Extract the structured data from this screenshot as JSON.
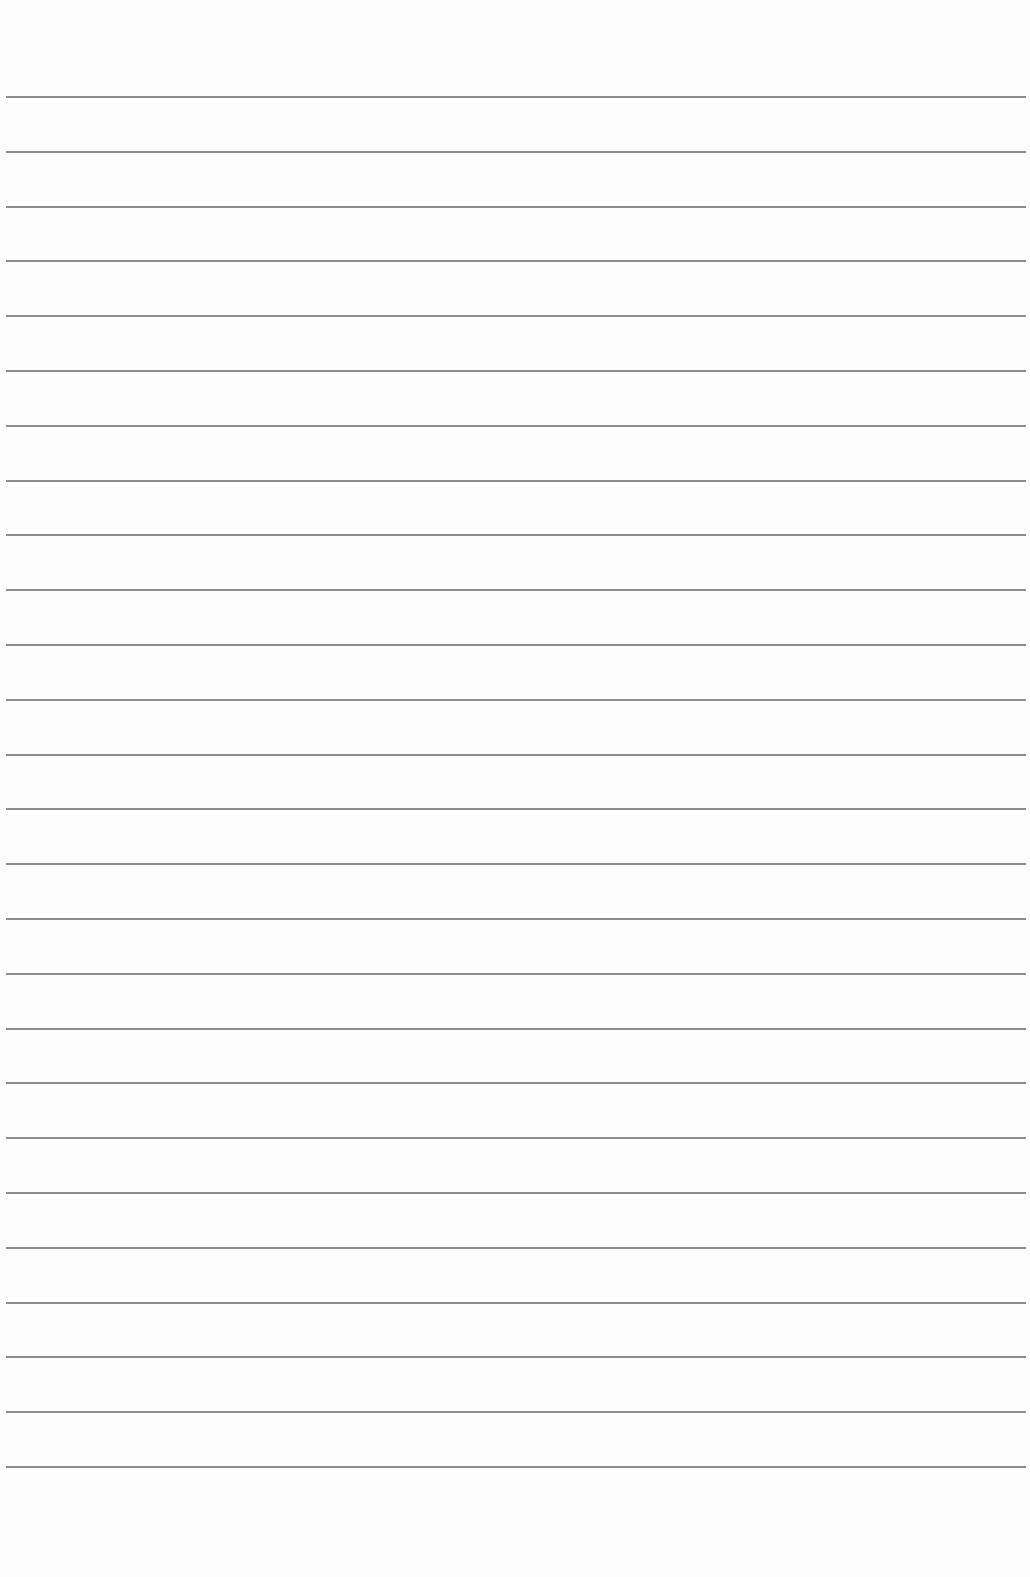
{
  "page": {
    "type": "ruled-paper",
    "background_color": "#fdfdfd",
    "line_color": "#8c8c8c",
    "line_count": 26,
    "first_line_y": 96,
    "line_spacing": 54.8,
    "text_content": []
  }
}
